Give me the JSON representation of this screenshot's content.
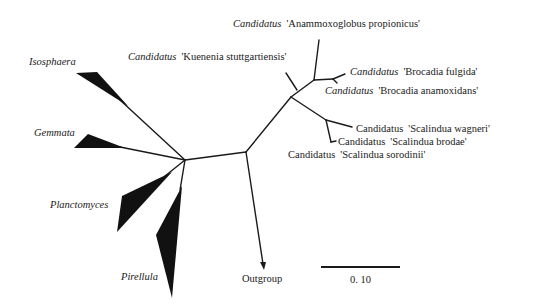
{
  "diagram": {
    "type": "unrooted phylogenetic tree",
    "genus_prefix": "Candidatus",
    "taxa": {
      "anammoxoglobus": "'Anammoxoglobus propionicus'",
      "kuenenia": "'Kuenenia stuttgartiensis'",
      "brocadia_fulgida": "'Brocadia fulgida'",
      "brocadia_anamoxidans": "'Brocadia anamoxidans'",
      "scalindua_wagneri": "'Scalindua wagneri'",
      "scalindua_brodae": "'Scalindua brodae'",
      "scalindua_sorokinii": "'Scalindua sorodinii'"
    },
    "groups": {
      "isosphaera": "Isosphaera",
      "gemmata": "Gemmata",
      "planctomyces": "Planctomyces",
      "pirellula": "Pirellula",
      "outgroup": "Outgroup"
    },
    "scale_bar": {
      "label": "0. 10"
    },
    "colors": {
      "line": "#1a1a1a",
      "background": "#ffffff"
    }
  }
}
